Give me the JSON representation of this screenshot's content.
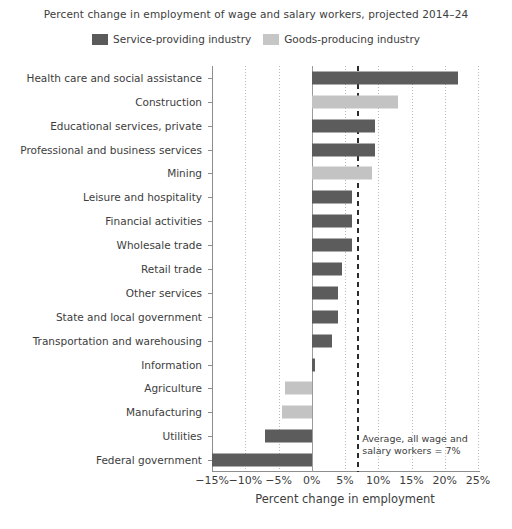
{
  "chart_data": {
    "type": "bar",
    "orientation": "horizontal",
    "title": "Percent change in employment of wage and salary workers, projected 2014–24",
    "xlabel": "Percent change in employment",
    "ylabel": "",
    "xlim": [
      -15,
      25
    ],
    "xticks": [
      -15,
      -10,
      -5,
      0,
      5,
      10,
      15,
      20,
      25
    ],
    "xticklabels": [
      "−15%",
      "−10%",
      "−5%",
      "0%",
      "5%",
      "10%",
      "15%",
      "20%",
      "25%"
    ],
    "grid": true,
    "legend_position": "top-center",
    "legend": [
      {
        "name": "Service-providing industry",
        "color": "#5c5c5c"
      },
      {
        "name": "Goods-producing industry",
        "color": "#c3c3c3"
      }
    ],
    "categories": [
      "Health care and social assistance",
      "Construction",
      "Educational services, private",
      "Professional and business services",
      "Mining",
      "Leisure and hospitality",
      "Financial activities",
      "Wholesale trade",
      "Retail trade",
      "Other services",
      "State and local government",
      "Transportation and warehousing",
      "Information",
      "Agriculture",
      "Manufacturing",
      "Utilities",
      "Federal government"
    ],
    "values": [
      22.0,
      13.0,
      9.5,
      9.5,
      9.0,
      6.0,
      6.0,
      6.0,
      4.5,
      4.0,
      4.0,
      3.0,
      0.5,
      -4.0,
      -4.5,
      -7.0,
      -15.0
    ],
    "groups": [
      "Service-providing industry",
      "Goods-producing industry",
      "Service-providing industry",
      "Service-providing industry",
      "Goods-producing industry",
      "Service-providing industry",
      "Service-providing industry",
      "Service-providing industry",
      "Service-providing industry",
      "Service-providing industry",
      "Service-providing industry",
      "Service-providing industry",
      "Service-providing industry",
      "Goods-producing industry",
      "Goods-producing industry",
      "Service-providing industry",
      "Service-providing industry"
    ],
    "annotations": [
      {
        "name": "average-reference-line",
        "text": "Average, all wage and\nsalary workers = 7%",
        "value": 7,
        "style": "dashed-vertical"
      }
    ]
  }
}
